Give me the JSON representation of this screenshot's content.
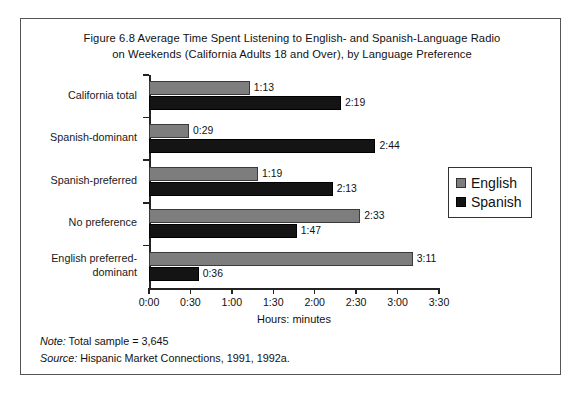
{
  "figure": {
    "title_line1": "Figure 6.8  Average Time Spent Listening to English- and Spanish-Language Radio",
    "title_line2": "on Weekends (California Adults 18 and Over), by Language Preference"
  },
  "footnotes": {
    "note_key": "Note:",
    "note_text": " Total sample = 3,645",
    "source_key": "Source:",
    "source_text": " Hispanic Market Connections, 1991, 1992a."
  },
  "legend": {
    "position": "right",
    "items": [
      {
        "label": "English",
        "color": "#7d7d7d"
      },
      {
        "label": "Spanish",
        "color": "#141414"
      }
    ]
  },
  "chart_data": {
    "type": "bar",
    "orientation": "horizontal",
    "title": "Figure 6.8  Average Time Spent Listening to English- and Spanish-Language Radio on Weekends (California Adults 18 and Over), by Language Preference",
    "xlabel": "Hours: minutes",
    "ylabel": "",
    "grid": false,
    "xlim": [
      0,
      210
    ],
    "xtick_values": [
      0,
      30,
      60,
      90,
      120,
      150,
      180,
      210
    ],
    "xtick_labels": [
      "0:00",
      "0:30",
      "1:00",
      "1:30",
      "2:00",
      "2:30",
      "3:00",
      "3:30"
    ],
    "categories": [
      "California total",
      "Spanish-dominant",
      "Spanish-preferred",
      "No preference",
      "English preferred-dominant"
    ],
    "category_lines": [
      [
        "California total"
      ],
      [
        "Spanish-dominant"
      ],
      [
        "Spanish-preferred"
      ],
      [
        "No preference"
      ],
      [
        "English preferred-",
        "dominant"
      ]
    ],
    "series": [
      {
        "name": "English",
        "color": "#7d7d7d",
        "values": [
          73,
          29,
          79,
          153,
          191
        ],
        "labels": [
          "1:13",
          "0:29",
          "1:19",
          "2:33",
          "3:11"
        ]
      },
      {
        "name": "Spanish",
        "color": "#141414",
        "values": [
          139,
          164,
          133,
          107,
          36
        ],
        "labels": [
          "2:19",
          "2:44",
          "2:13",
          "1:47",
          "0:36"
        ]
      }
    ]
  }
}
